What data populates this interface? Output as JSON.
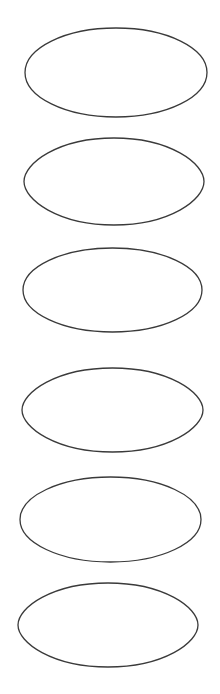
{
  "canvas": {
    "width": 220,
    "height": 694,
    "background": "#ffffff"
  },
  "stroke_color": "#3a3a3a",
  "shapes": [
    {
      "kind": "ellipse",
      "x1": 25,
      "y1": 28,
      "x2": 207,
      "y2": 117
    },
    {
      "kind": "lens",
      "x1": 24,
      "y1": 138,
      "x2": 204,
      "y2": 225
    },
    {
      "kind": "ellipse",
      "x1": 23,
      "y1": 248,
      "x2": 202,
      "y2": 332
    },
    {
      "kind": "lens",
      "x1": 22,
      "y1": 368,
      "x2": 203,
      "y2": 452
    },
    {
      "kind": "ellipse",
      "x1": 20,
      "y1": 477,
      "x2": 201,
      "y2": 562
    },
    {
      "kind": "lens",
      "x1": 18,
      "y1": 583,
      "x2": 198,
      "y2": 667
    }
  ]
}
